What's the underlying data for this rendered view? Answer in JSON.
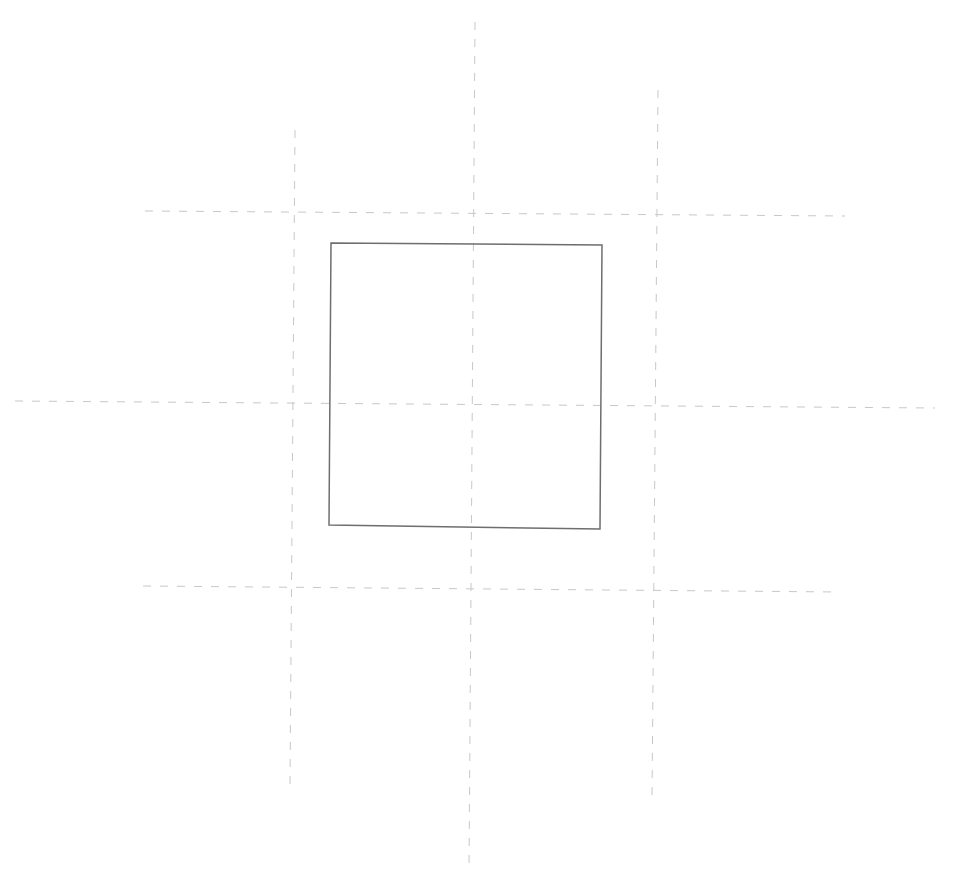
{
  "diagram": {
    "background": "#ffffff",
    "width": 958,
    "height": 890,
    "guide_color": "#c8c8c8",
    "guide_dash": "8 9",
    "guide_width": 1,
    "shape_color": "#6e6e6e",
    "shape_width": 1.5,
    "guides": {
      "vertical": [
        {
          "id": "left",
          "x1": 295,
          "y1": 130,
          "x2": 290,
          "y2": 785
        },
        {
          "id": "center",
          "x1": 475,
          "y1": 22,
          "x2": 469,
          "y2": 870
        },
        {
          "id": "right",
          "x1": 658,
          "y1": 90,
          "x2": 652,
          "y2": 800
        }
      ],
      "horizontal": [
        {
          "id": "top",
          "x1": 145,
          "y1": 211,
          "x2": 845,
          "y2": 216
        },
        {
          "id": "middle",
          "x1": 15,
          "y1": 401,
          "x2": 935,
          "y2": 408
        },
        {
          "id": "bottom",
          "x1": 143,
          "y1": 586,
          "x2": 840,
          "y2": 592
        }
      ]
    },
    "square": {
      "points": [
        [
          331,
          243
        ],
        [
          602,
          245
        ],
        [
          600,
          529
        ],
        [
          329,
          525
        ]
      ]
    }
  }
}
